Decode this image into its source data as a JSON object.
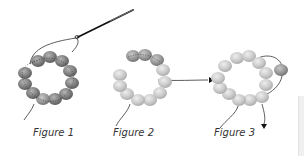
{
  "figures": [
    {
      "id": "figure-1",
      "caption": "Figure 1",
      "center": [
        53,
        86
      ],
      "bead_color": "#8a8a8a",
      "highlight": []
    },
    {
      "id": "figure-2",
      "caption": "Figure 2",
      "center": [
        140,
        88
      ],
      "bead_color": "#c4c4c4",
      "highlight": [
        0,
        1,
        2
      ]
    },
    {
      "id": "figure-3",
      "caption": "Figure 3",
      "center": [
        238,
        88
      ],
      "bead_color": "#c4c4c4",
      "highlight": []
    }
  ],
  "colors": {
    "thread": "#333333",
    "needle": "#111111",
    "dark_bead": "#7a7a7a",
    "light_bead": "#c8c8c8",
    "caption": "#333333",
    "background": "#ffffff"
  }
}
